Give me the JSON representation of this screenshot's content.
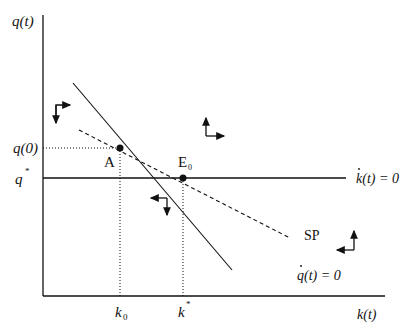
{
  "diagram": {
    "y_axis_label": "q(t)",
    "x_axis_label": "k(t)",
    "y_ticks": {
      "q0": "q(0)",
      "qstar": "q",
      "qstar_sup": "*"
    },
    "x_ticks": {
      "k0": "k",
      "k0_sub": "0",
      "kstar": "k",
      "kstar_sup": "*"
    },
    "points": {
      "A": "A",
      "E0": "E",
      "E0_sub": "0"
    },
    "curves": {
      "kdot_zero": "k(t) = 0",
      "qdot_zero": "q(t) = 0",
      "saddle_path": "SP"
    },
    "colors": {
      "ink": "#111111",
      "background": "#ffffff"
    }
  }
}
